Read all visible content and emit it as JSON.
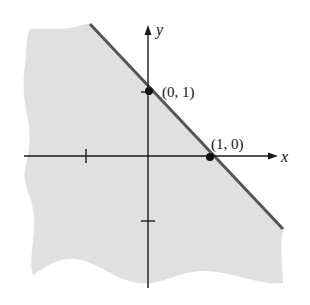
{
  "figure": {
    "colors": {
      "shade": "#e0e0e0",
      "boundary": "#555555",
      "axis": "#1a1a1a",
      "point": "#111111"
    },
    "axes": {
      "x_label": "x",
      "y_label": "y",
      "x_ticks": [
        -1,
        1
      ],
      "y_ticks": [
        -1,
        1
      ]
    },
    "points": [
      {
        "label": "(0, 1)",
        "x": 0,
        "y": 1
      },
      {
        "label": "(1, 0)",
        "x": 1,
        "y": 0
      }
    ],
    "boundary_line": {
      "equation": "x + y = 1",
      "style": "solid"
    },
    "shaded_region": "below-left of line"
  }
}
